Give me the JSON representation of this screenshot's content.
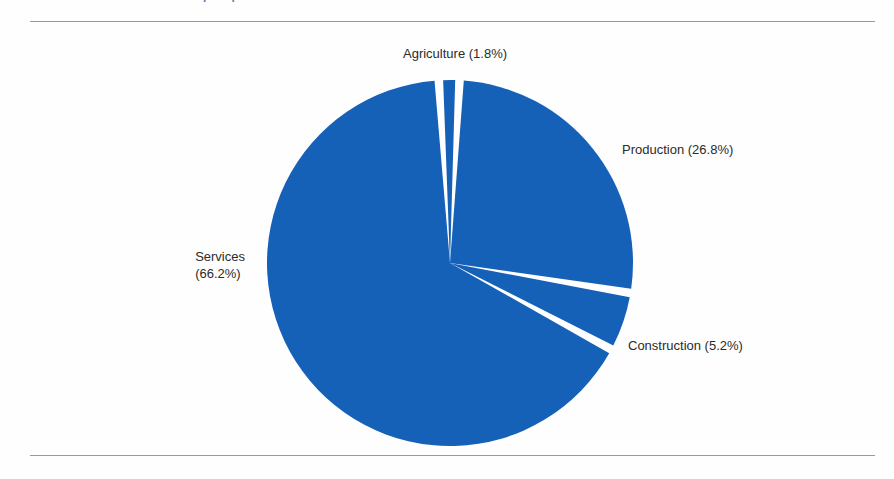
{
  "figure": {
    "title_fragment": "Grafico 1. Distribucion del empleo por sector de actividad",
    "background_color": "#fefefe",
    "rule_color": "#9a9a9a"
  },
  "labels": {
    "agriculture": "Agriculture (1.8%)",
    "production": "Production (26.8%)",
    "construction": "Construction (5.2%)",
    "services_name": "Services",
    "services_value": "(66.2%)"
  },
  "chart_data": {
    "type": "pie",
    "title": "",
    "xlabel": "",
    "ylabel": "",
    "legend_position": "none",
    "grid": false,
    "slice_color": "#1561b8",
    "separator_color": "#ffffff",
    "start_angle_deg": -93.5,
    "direction": "clockwise",
    "center": [
      450,
      263
    ],
    "radius": 183,
    "categories": [
      "Agriculture",
      "Production",
      "Construction",
      "Services"
    ],
    "values": [
      1.8,
      26.8,
      5.2,
      66.2
    ],
    "units": "percent",
    "labels": [
      "Agriculture (1.8%)",
      "Production (26.8%)",
      "Construction (5.2%)",
      "Services (66.2%)"
    ],
    "colors": [
      "#1561b8",
      "#1561b8",
      "#1561b8",
      "#1561b8"
    ]
  }
}
